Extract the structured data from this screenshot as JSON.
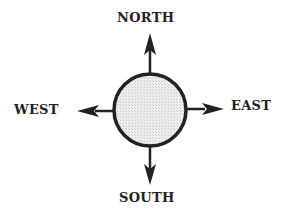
{
  "diagram": {
    "type": "compass-rose",
    "labels": {
      "north": "NORTH",
      "south": "SOUTH",
      "east": "EAST",
      "west": "WEST"
    },
    "colors": {
      "stroke": "#222222",
      "fill": "#e6e6e6",
      "background": "#ffffff"
    }
  }
}
